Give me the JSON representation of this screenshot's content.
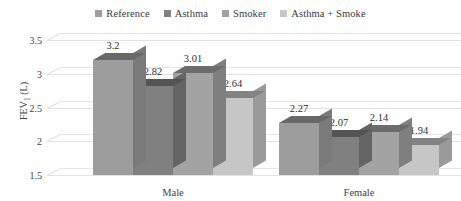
{
  "chart_data": {
    "type": "bar",
    "title": "",
    "subtitle": "",
    "xlabel": "",
    "ylabel": "FEV1 (L)",
    "ylabel_base": "FEV",
    "ylabel_sub": "1",
    "ylabel_unit": " (L)",
    "categories": [
      "Male",
      "Female"
    ],
    "series": [
      {
        "name": "Reference",
        "values": [
          3.2,
          2.27
        ],
        "color": "#9d9d9d"
      },
      {
        "name": "Asthma",
        "values": [
          2.82,
          2.07
        ],
        "color": "#808080"
      },
      {
        "name": "Smoker",
        "values": [
          3.01,
          2.14
        ],
        "color": "#a3a3a3"
      },
      {
        "name": "Asthma + Smoke",
        "values": [
          2.64,
          1.94
        ],
        "color": "#c6c6c6"
      }
    ],
    "ylim": [
      1.5,
      3.5
    ],
    "yticks": [
      "3.5",
      "3",
      "2.5",
      "2",
      "1.5"
    ],
    "ytick_values": [
      3.5,
      3,
      2.5,
      2,
      1.5
    ],
    "grid": true,
    "legend_position": "top",
    "style": "3d-clustered-column",
    "data_labels": [
      [
        "3.2",
        "2.82",
        "3.01",
        "2.64"
      ],
      [
        "2.27",
        "2.07",
        "2.14",
        "1.94"
      ]
    ]
  },
  "colors": {
    "background": "#ffffff",
    "gridline": "#e3e3e3",
    "text": "#3f3f3f",
    "label_text": "#2f2f2f"
  }
}
